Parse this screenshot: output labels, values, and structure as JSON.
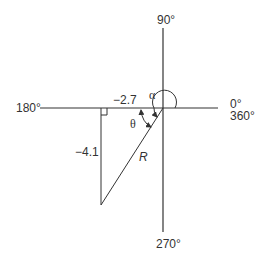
{
  "diagram": {
    "type": "polar-to-rectangular conversion diagram",
    "axis_labels": {
      "top": "90°",
      "left": "180°",
      "right_top": "0°",
      "right_bottom": "360°",
      "bottom": "270°"
    },
    "triangle": {
      "horizontal_side_label": "−2.7",
      "vertical_side_label": "−4.1",
      "hypotenuse_label": "R"
    },
    "angles": {
      "alpha_label": "α",
      "theta_label": "θ"
    },
    "colors": {
      "line": "#333333",
      "background": "#ffffff"
    }
  }
}
